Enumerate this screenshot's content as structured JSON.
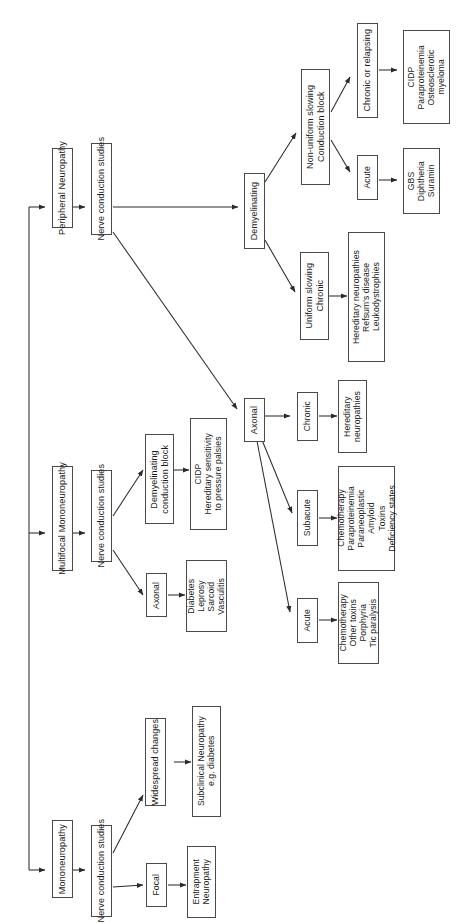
{
  "diagram": {
    "orientation": "rotated-90-ccw",
    "line_color": "#2b2b2b",
    "box_border_color": "#4a4a4a",
    "background": "#ffffff"
  },
  "nodes": {
    "peripheral_neuropathy": "Peripheral Neuropathy",
    "ncs_top": "Nerve conduction studies",
    "demyelinating": "Demyelinating",
    "non_uniform": "Non-uniform slowing\nConduction block",
    "chronic_or_relapsing": "Chronic or relapsing",
    "cidp_para_osteo": "CIDP\nParaproteinemia\nOsteosclerotic\nmyeloma",
    "acute_demyel": "Acute",
    "gbs_diph_suramin": "GBS\nDiphtheria\nSuramin",
    "uniform_slowing": "Uniform slowing\nChronic",
    "hereditary_refsum_leuko": "Hereditary neuropathies\nRefsum's disease\nLeukodystrophies",
    "axonal_main": "Axonal",
    "axonal_chronic": "Chronic",
    "hereditary_neuropathies": "Hereditary\nneuropathies",
    "axonal_subacute": "Subacute",
    "chemo_para_paraneo": "Chemotherapy\nParaproteinemia\nParaneoplastic\nAmyloid\nToxins\nDeficiency states",
    "axonal_acute": "Acute",
    "chemo_toxins_porph": "Chemotherapy\nOther toxins\nPorphyria\nTic paralysis",
    "multifocal_mononeuropathy": "Multifocal Mononeuropathy",
    "ncs_mid": "Nerve conduction studies",
    "demyelinating_cb": "Demyelinating\nconduction block",
    "cidp_hereditary_sens": "CIDP\nHereditary sensitivity\nto pressure palsies",
    "axonal_mid": "Axonal",
    "diabetes_leprosy": "Diabetes\nLeprosy\nSarcoid\nVasculitis",
    "mononeuropathy": "Mononeuropathy",
    "ncs_bottom": "Nerve conduction studies",
    "widespread_changes": "Widespread changes",
    "subclinical_neuropathy": "Subclinical Neuropathy\ne.g. diabetes",
    "focal": "Focal",
    "entrapment_neuropathy": "Entrapment\nNeuropathy"
  }
}
